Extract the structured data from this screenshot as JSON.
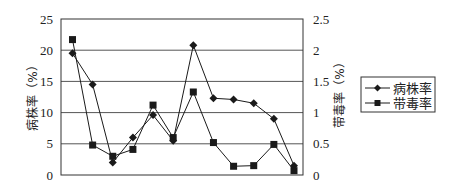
{
  "chart_data": {
    "type": "line",
    "title": "",
    "x": [
      1,
      2,
      3,
      4,
      5,
      6,
      7,
      8,
      9,
      10,
      11,
      12
    ],
    "xlabel": "",
    "ylabel": "病株率（%）",
    "ylabel_right": "带毒率（%）",
    "ylim": [
      0,
      25
    ],
    "ylim_right": [
      0,
      2.5
    ],
    "yticks": [
      "0",
      "5",
      "10",
      "15",
      "20",
      "25"
    ],
    "yticks_right": [
      "0",
      "0.5",
      "1",
      "1.5",
      "2",
      "2.5"
    ],
    "grid": true,
    "legend_position": "right",
    "series": [
      {
        "name": "病株率",
        "axis": "left",
        "marker": "diamond",
        "values": [
          19.5,
          14.5,
          2.0,
          6.0,
          9.6,
          5.5,
          20.8,
          12.3,
          12.1,
          11.5,
          9.0,
          1.5
        ]
      },
      {
        "name": "带毒率",
        "axis": "right",
        "marker": "square",
        "values": [
          2.17,
          0.48,
          0.3,
          0.41,
          1.12,
          0.6,
          1.33,
          0.52,
          0.14,
          0.15,
          0.49,
          0.07
        ]
      }
    ]
  },
  "axes": {
    "left_title": "病株率（%）",
    "right_title": "带毒率（%）",
    "left_ticks": [
      "0",
      "5",
      "10",
      "15",
      "20",
      "25"
    ],
    "right_ticks": [
      "0",
      "0.5",
      "1",
      "1.5",
      "2",
      "2.5"
    ]
  },
  "legend": {
    "items": [
      {
        "label": "病株率",
        "marker": "diamond-icon"
      },
      {
        "label": "带毒率",
        "marker": "square-icon"
      }
    ]
  },
  "colors": {
    "line": "#1a1a1a",
    "grid": "#555555",
    "background": "#ffffff"
  }
}
